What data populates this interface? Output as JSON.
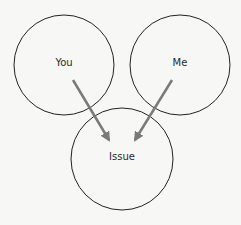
{
  "diagram": {
    "nodes": [
      {
        "id": "you",
        "label": "You",
        "cx": 64,
        "cy": 65,
        "r": 50
      },
      {
        "id": "me",
        "label": "Me",
        "cx": 180,
        "cy": 65,
        "r": 50
      },
      {
        "id": "issue",
        "label": "Issue",
        "cx": 122,
        "cy": 159,
        "r": 51
      }
    ],
    "edges": [
      {
        "from": "you",
        "to": "issue"
      },
      {
        "from": "me",
        "to": "issue"
      }
    ],
    "colors": {
      "circle_stroke": "#222222",
      "arrow": "#7a7a7a",
      "background": "#f7f7f5"
    }
  }
}
